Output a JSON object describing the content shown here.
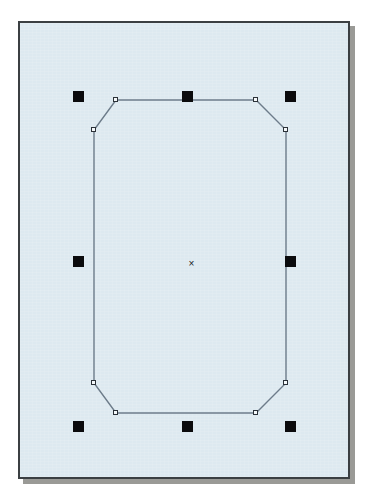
{
  "app": {
    "window_title": "Vector Editor — Drawing Canvas",
    "document_name": "Untitled Drawing"
  },
  "canvas": {
    "background_color": "#dde9f0",
    "border_color": "#3b3f42",
    "shadow_color": "#9a9a96",
    "page_background": "#ffffff",
    "left": 18,
    "top": 21,
    "width": 332,
    "height": 458
  },
  "selection": {
    "state": "selected",
    "handle_color": "#0b0b0d",
    "handle_size": 11,
    "handle_count": 8,
    "handles": [
      {
        "name": "handle-top-left",
        "role": "resize-nw",
        "x": 71,
        "y": 89
      },
      {
        "name": "handle-top-center",
        "role": "resize-n",
        "x": 180,
        "y": 89
      },
      {
        "name": "handle-top-right",
        "role": "resize-ne",
        "x": 283,
        "y": 89
      },
      {
        "name": "handle-middle-left",
        "role": "resize-w",
        "x": 71,
        "y": 254
      },
      {
        "name": "handle-middle-right",
        "role": "resize-e",
        "x": 283,
        "y": 254
      },
      {
        "name": "handle-bottom-left",
        "role": "resize-sw",
        "x": 71,
        "y": 419
      },
      {
        "name": "handle-bottom-center",
        "role": "resize-s",
        "x": 180,
        "y": 419
      },
      {
        "name": "handle-bottom-right",
        "role": "resize-se",
        "x": 283,
        "y": 419
      }
    ],
    "center_marker": {
      "glyph": "×",
      "x": 185,
      "y": 257
    }
  },
  "shape": {
    "id": "octagon-path",
    "type": "octagon",
    "label": "Rounded rectangle with chamfered corners",
    "stroke_color": "#6d7c8a",
    "stroke_width": 1.4,
    "fill": "none",
    "node_marker_color": "#f4f8fa",
    "node_marker_border": "#2b3138",
    "node_count": 8,
    "vertices": [
      {
        "name": "node-top-left",
        "x": 114,
        "y": 98
      },
      {
        "name": "node-top-right",
        "x": 254,
        "y": 98
      },
      {
        "name": "node-right-upper",
        "x": 284,
        "y": 128
      },
      {
        "name": "node-right-lower",
        "x": 284,
        "y": 381
      },
      {
        "name": "node-bottom-right",
        "x": 254,
        "y": 411
      },
      {
        "name": "node-bottom-left",
        "x": 114,
        "y": 411
      },
      {
        "name": "node-left-lower",
        "x": 92,
        "y": 381
      },
      {
        "name": "node-left-upper",
        "x": 92,
        "y": 128
      }
    ],
    "bounding_box": {
      "x": 92,
      "y": 98,
      "width": 192,
      "height": 313
    }
  },
  "chart_data": {
    "type": "scatter",
    "xlabel": "",
    "ylabel": "",
    "xlim": [
      0,
      367
    ],
    "ylim": [
      0,
      502
    ],
    "grid": false,
    "series": [
      {
        "name": "shape-vertices",
        "x": [
          114,
          254,
          284,
          284,
          254,
          114,
          92,
          92
        ],
        "y": [
          98,
          98,
          128,
          381,
          411,
          411,
          381,
          128
        ]
      },
      {
        "name": "selection-handles",
        "x": [
          71,
          180,
          283,
          71,
          283,
          71,
          180,
          283
        ],
        "y": [
          89,
          89,
          89,
          254,
          254,
          419,
          419,
          419
        ]
      },
      {
        "name": "center-marker",
        "x": [
          190
        ],
        "y": [
          262
        ]
      }
    ]
  }
}
